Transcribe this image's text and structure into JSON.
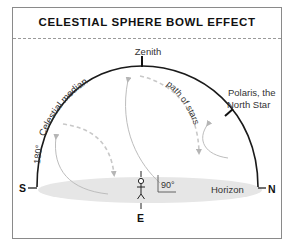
{
  "title": "CELESTIAL SPHERE BOWL EFFECT",
  "labels": {
    "zenith": "Zenith",
    "celestial_median": "Celestial median",
    "angle_180": "180°",
    "path_of_stars": "path of stars",
    "polaris_line1": "Polaris, the",
    "polaris_line2": "North Star",
    "angle_90": "90°",
    "horizon": "Horizon",
    "south": "S",
    "north": "N",
    "east": "E"
  },
  "colors": {
    "arc": "#1a1a1a",
    "horizon_fill": "#e6e6e6",
    "star_path": "#bdbdbd",
    "dashed_path": "#c8c8c8",
    "frame": "#8a8a8a"
  }
}
